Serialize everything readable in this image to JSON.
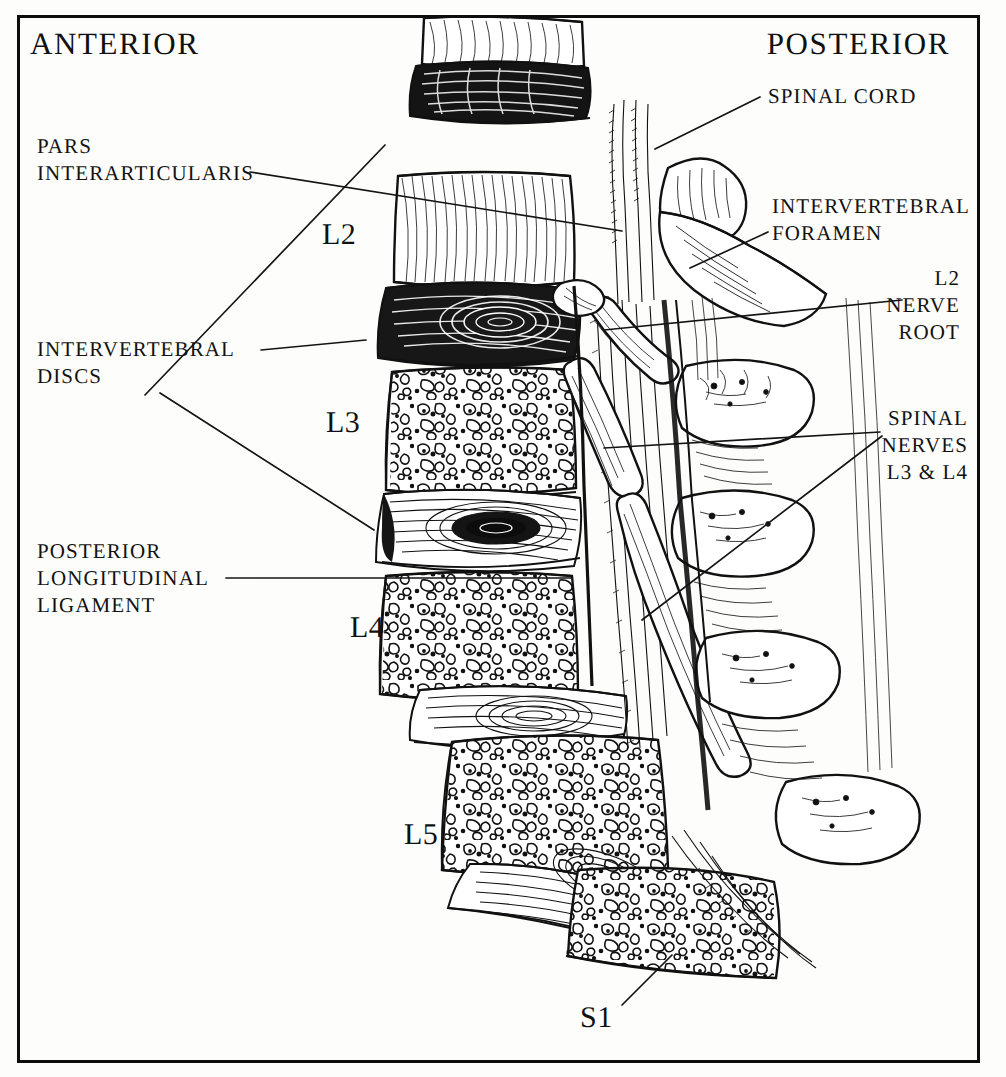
{
  "figure": {
    "orientation": {
      "left_label": "ANTERIOR",
      "right_label": "POSTERIOR"
    },
    "frame_color": "#0d0d0d",
    "ink_color": "#111111",
    "background_color": "#fdfdfb"
  },
  "labels_left": [
    {
      "id": "pars-interarticularis",
      "text": "PARS\nINTERARTICULARIS",
      "lines": [
        "PARS",
        "INTERARTICULARIS"
      ]
    },
    {
      "id": "intervertebral-discs",
      "text": "INTERVERTEBRAL\nDISCS",
      "lines": [
        "INTERVERTEBRAL",
        "DISCS"
      ]
    },
    {
      "id": "posterior-longitudinal-ligament",
      "text": "POSTERIOR\nLONGITUDINAL\nLIGAMENT",
      "lines": [
        "POSTERIOR",
        "LONGITUDINAL",
        "LIGAMENT"
      ]
    }
  ],
  "labels_right": [
    {
      "id": "spinal-cord",
      "text": "SPINAL CORD",
      "lines": [
        "SPINAL CORD"
      ]
    },
    {
      "id": "intervertebral-foramen",
      "text": "INTERVERTEBRAL\nFORAMEN",
      "lines": [
        "INTERVERTEBRAL",
        "FORAMEN"
      ]
    },
    {
      "id": "l2-nerve-root",
      "text": "L2\nNERVE\nROOT",
      "lines": [
        "L2",
        "NERVE",
        "ROOT"
      ]
    },
    {
      "id": "spinal-nerves-l3-l4",
      "text": "SPINAL\nNERVES\nL3 & L4",
      "lines": [
        "SPINAL",
        "NERVES",
        "L3 & L4"
      ]
    }
  ],
  "vertebra_labels": [
    {
      "id": "L2",
      "text": "L2"
    },
    {
      "id": "L3",
      "text": "L3"
    },
    {
      "id": "L4",
      "text": "L4"
    },
    {
      "id": "L5",
      "text": "L5"
    },
    {
      "id": "S1",
      "text": "S1"
    }
  ],
  "text": {
    "anterior": "ANTERIOR",
    "posterior": "POSTERIOR",
    "pars_l1": "PARS",
    "pars_l2": "INTERARTICULARIS",
    "discs_l1": "INTERVERTEBRAL",
    "discs_l2": "DISCS",
    "pll_l1": "POSTERIOR",
    "pll_l2": "LONGITUDINAL",
    "pll_l3": "LIGAMENT",
    "cord_l1": "SPINAL CORD",
    "foramen_l1": "INTERVERTEBRAL",
    "foramen_l2": "FORAMEN",
    "root_l1": "L2",
    "root_l2": "NERVE",
    "root_l3": "ROOT",
    "nerves_l1": "SPINAL",
    "nerves_l2": "NERVES",
    "nerves_l3": "L3 & L4",
    "v_l2": "L2",
    "v_l3": "L3",
    "v_l4": "L4",
    "v_l5": "L5",
    "v_s1": "S1"
  }
}
